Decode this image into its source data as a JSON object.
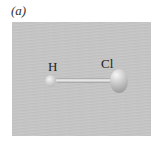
{
  "figure": {
    "panel_label": "(a)",
    "molecule": {
      "atoms": [
        {
          "symbol": "H",
          "label": "H"
        },
        {
          "symbol": "Cl",
          "label": "Cl"
        }
      ],
      "bond": "H-Cl single bond"
    }
  }
}
